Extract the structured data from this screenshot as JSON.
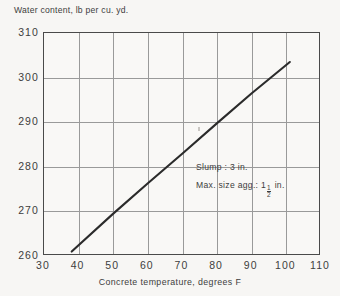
{
  "chart_data": {
    "type": "line",
    "title": "",
    "ylabel": "Water content, lb per cu. yd.",
    "xlabel": "Concrete temperature, degrees F",
    "xlim": [
      30,
      110
    ],
    "ylim": [
      260,
      310
    ],
    "xticks": [
      30,
      40,
      50,
      60,
      70,
      80,
      90,
      100,
      110
    ],
    "yticks": [
      260,
      270,
      280,
      290,
      300,
      310
    ],
    "grid": true,
    "legend": "none",
    "series": [
      {
        "name": "Water content vs concrete temperature",
        "x": [
          38,
          50,
          60,
          70,
          80,
          90,
          101
        ],
        "values": [
          261,
          269.5,
          276.3,
          283.0,
          289.8,
          296.5,
          303.5
        ]
      }
    ],
    "annotations": [
      {
        "text": "Slump: 3 in.",
        "x": 82,
        "y": 277
      },
      {
        "text": "Max. size agg.: 1",
        "fraction_num": "1",
        "fraction_den": "2",
        "suffix": " in.",
        "x": 82,
        "y": 273
      }
    ]
  },
  "axes": {
    "y_title": "Water content, lb per cu. yd.",
    "x_title": "Concrete temperature, degrees F",
    "y_tick_labels": [
      "310",
      "300",
      "290",
      "280",
      "270",
      "260"
    ],
    "x_tick_labels": [
      "30",
      "40",
      "50",
      "60",
      "70",
      "80",
      "90",
      "100",
      "110"
    ]
  },
  "annotations": {
    "slump": "Slump : 3 in.",
    "max_size_prefix": "Max. size agg.:",
    "max_size_whole": "1",
    "max_size_num": "1",
    "max_size_den": "2",
    "max_size_unit": "in."
  },
  "colors": {
    "background": "#f7f6f4",
    "plot_background": "#f9f8f6",
    "axis": "#4a4a4a",
    "grid": "#9a9a9a",
    "data_line": "#2b2b2b",
    "text": "#3d3d3d"
  }
}
